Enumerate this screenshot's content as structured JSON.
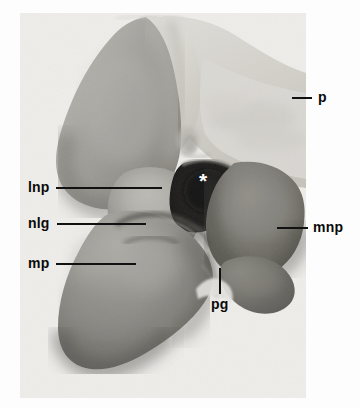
{
  "figure": {
    "kind": "scanning-electron-micrograph",
    "background_color": "#fdfdfd",
    "panel": {
      "left": 20,
      "top": 13,
      "width": 286,
      "height": 385,
      "base_color": "#e9e9e7"
    }
  },
  "annotations": {
    "markers": [
      {
        "id": "asterisk",
        "name": "asterisk-marker",
        "text": "*",
        "color": "#ffffff",
        "x": 199,
        "y": 170
      }
    ],
    "labels": [
      {
        "id": "lnp",
        "name": "label-lnp",
        "text": "lnp",
        "meaning": "lateral nasal process",
        "text_x": 28,
        "text_y": 180,
        "leader": {
          "orientation": "horizontal",
          "x": 56,
          "y": 187,
          "length": 106
        }
      },
      {
        "id": "nlg",
        "name": "label-nlg",
        "text": "nlg",
        "meaning": "nasolacrimal groove",
        "text_x": 28,
        "text_y": 216,
        "leader": {
          "orientation": "horizontal",
          "x": 57,
          "y": 223,
          "length": 89
        }
      },
      {
        "id": "mp",
        "name": "label-mp",
        "text": "mp",
        "meaning": "maxillary process",
        "text_x": 28,
        "text_y": 256,
        "leader": {
          "orientation": "horizontal",
          "x": 56,
          "y": 263,
          "length": 80
        }
      },
      {
        "id": "p",
        "name": "label-p",
        "text": "p",
        "meaning": "prosencephalon",
        "text_x": 318,
        "text_y": 90,
        "leader": {
          "orientation": "horizontal",
          "x": 292,
          "y": 97,
          "length": 20
        }
      },
      {
        "id": "mnp",
        "name": "label-mnp",
        "text": "mnp",
        "meaning": "medial nasal process",
        "text_x": 313,
        "text_y": 220,
        "leader": {
          "orientation": "horizontal",
          "x": 277,
          "y": 227,
          "length": 31
        }
      },
      {
        "id": "pg",
        "name": "label-pg",
        "text": "pg",
        "meaning": "primary palate groove",
        "text_x": 211,
        "text_y": 297,
        "leader": {
          "orientation": "vertical",
          "x": 219,
          "y": 268,
          "length": 26
        }
      }
    ]
  },
  "tones": {
    "background_light": "#eceae7",
    "brain_light": "#dcdad5",
    "brain_mid": "#cdcac4",
    "lnp_mid": "#9a9893",
    "lnp_light": "#b4b2ad",
    "mp_dark": "#79766f",
    "mnp_dark": "#6e6b64",
    "cavity_black": "#141414",
    "shadow_deep": "#4a4842"
  }
}
